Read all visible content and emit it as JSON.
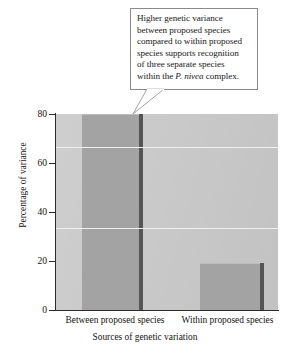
{
  "callout": {
    "line1": "Higher genetic variance",
    "line2": "between proposed species",
    "line3": "compared to within proposed",
    "line4": "species supports recognition",
    "line5": "of three separate species",
    "line6_pre": "within the ",
    "line6_italic": "P. nivea",
    "line6_post": " complex.",
    "full_text": "Higher genetic variance between proposed species compared to within proposed species supports recognition of three separate species within the P. nivea complex."
  },
  "chart_data": {
    "type": "bar",
    "title": "",
    "categories": [
      "Between proposed species",
      "Within proposed species"
    ],
    "values": [
      80,
      19
    ],
    "xlabel": "Sources of genetic variation",
    "ylabel": "Percentage of variance",
    "ylim": [
      0,
      80
    ],
    "yticks": [
      0,
      20,
      40,
      60,
      80
    ],
    "ytick_labels": [
      "0",
      "20",
      "40",
      "60",
      "80"
    ],
    "gridlines": [
      33.3,
      66.7
    ],
    "grid": true,
    "legend": "none",
    "bar_color": "#a3a3a3",
    "plot_background": "#c9c9c9",
    "gridline_color": "#efefef",
    "axis_color": "#2b2b2b"
  }
}
